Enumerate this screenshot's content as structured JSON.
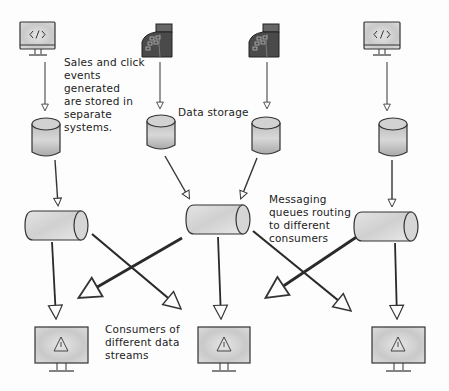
{
  "diagram": {
    "annotations": [
      {
        "id": "annotation-sources",
        "text": "Sales and click\nevents\ngenerated\nare stored in\nseparate\nsystems."
      },
      {
        "id": "annotation-storage",
        "text": "Data storage"
      },
      {
        "id": "annotation-queues",
        "text": "Messaging\nqueues routing\nto different\nconsumers"
      },
      {
        "id": "annotation-consumers",
        "text": "Consumers of\ndifferent data\nstreams"
      }
    ],
    "sources": [
      {
        "icon": "web-app-monitor-icon",
        "label": "Click events (web)"
      },
      {
        "icon": "cash-register-icon",
        "label": "Sales events (POS)"
      },
      {
        "icon": "cash-register-icon",
        "label": "Sales events (POS)"
      },
      {
        "icon": "web-app-monitor-icon",
        "label": "Click events (web)"
      }
    ],
    "storage": [
      {
        "icon": "database-icon"
      },
      {
        "icon": "database-icon"
      },
      {
        "icon": "database-icon"
      },
      {
        "icon": "database-icon"
      }
    ],
    "queues": [
      {
        "icon": "message-queue-icon"
      },
      {
        "icon": "message-queue-icon"
      },
      {
        "icon": "message-queue-icon"
      }
    ],
    "consumers": [
      {
        "icon": "alert-monitor-icon"
      },
      {
        "icon": "alert-monitor-icon"
      },
      {
        "icon": "alert-monitor-icon"
      }
    ],
    "edges": [
      {
        "from": "source-1",
        "to": "db-1"
      },
      {
        "from": "source-2",
        "to": "db-2"
      },
      {
        "from": "source-3",
        "to": "db-3"
      },
      {
        "from": "source-4",
        "to": "db-4"
      },
      {
        "from": "db-1",
        "to": "queue-1"
      },
      {
        "from": "db-2",
        "to": "queue-2"
      },
      {
        "from": "db-3",
        "to": "queue-2"
      },
      {
        "from": "db-4",
        "to": "queue-3"
      },
      {
        "from": "queue-1",
        "to": "consumer-1"
      },
      {
        "from": "queue-1",
        "to": "consumer-2"
      },
      {
        "from": "queue-2",
        "to": "consumer-1"
      },
      {
        "from": "queue-2",
        "to": "consumer-2"
      },
      {
        "from": "queue-2",
        "to": "consumer-3"
      },
      {
        "from": "queue-3",
        "to": "consumer-2"
      },
      {
        "from": "queue-3",
        "to": "consumer-3"
      }
    ],
    "colors": {
      "stroke": "#2a2a2a",
      "fill_light": "#d8d8d8",
      "fill_dark": "#555555",
      "background": "#fdfdfd"
    }
  }
}
